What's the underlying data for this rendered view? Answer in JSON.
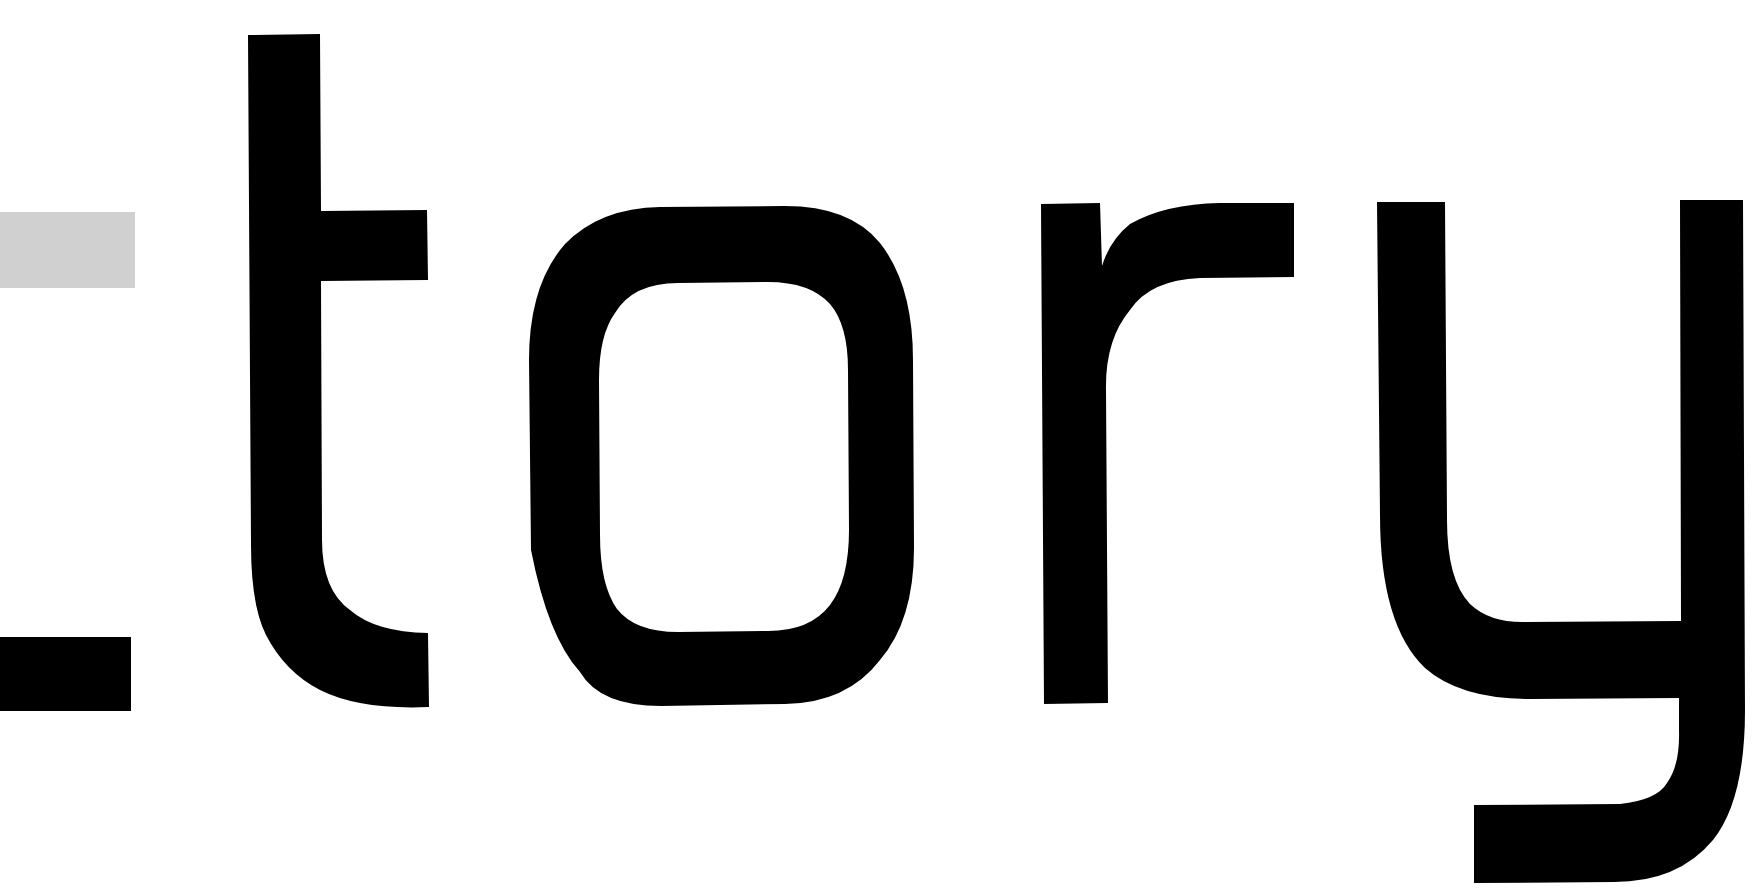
{
  "image": {
    "description": "Cropped close-up of large geometric sans-serif lettering",
    "visible_text": "tory",
    "partial_glyph_left": "partial letter (cut off) with gray top bar and black bottom bar"
  },
  "colors": {
    "background": "#ffffff",
    "glyph": "#000000",
    "partial_glyph_top_bar": "#d0d0d0"
  }
}
